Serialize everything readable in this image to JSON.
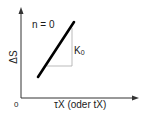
{
  "diagram": {
    "y_axis_label": "ΔS",
    "x_axis_label": "τX (oder tX)",
    "origin_label": "0",
    "line_label": "n = 0",
    "slope_label_base": "K",
    "slope_label_sub": "0"
  },
  "colors": {
    "axis": "#333333",
    "line": "#000000",
    "triangle": "#aaaaaa",
    "text": "#1a1a1a"
  }
}
